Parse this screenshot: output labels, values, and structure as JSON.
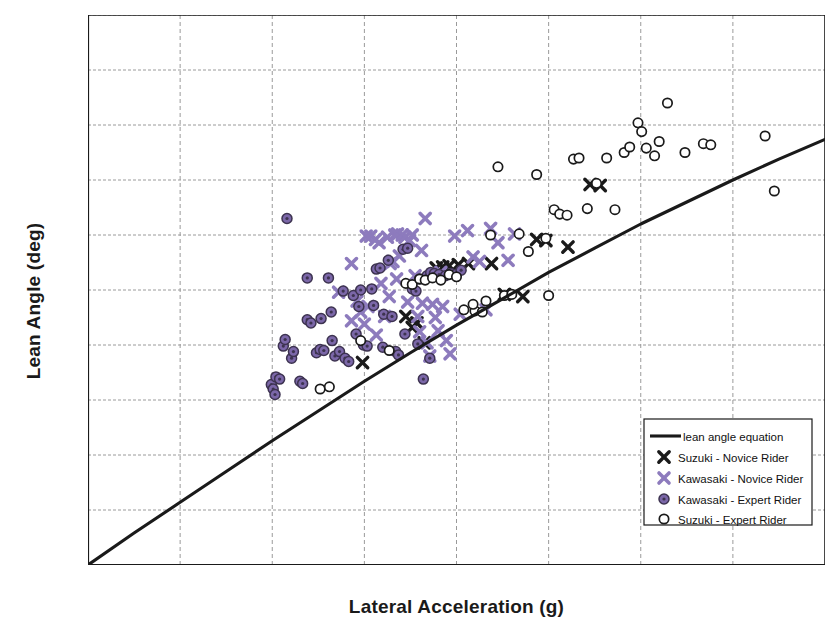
{
  "chart_data": {
    "type": "scatter",
    "title": "",
    "xlabel": "Lateral Acceleration (g)",
    "ylabel": "Lean Angle (deg)",
    "xlim": [
      0.0,
      0.8
    ],
    "ylim": [
      0,
      50
    ],
    "xticks": [
      "0.0",
      "0.1",
      "0.2",
      "0.3",
      "0.4",
      "0.5",
      "0.6",
      "0.7",
      "0.8"
    ],
    "xtick_values": [
      0.0,
      0.1,
      0.2,
      0.3,
      0.4,
      0.5,
      0.6,
      0.7,
      0.8
    ],
    "yticks": [
      "0",
      "5",
      "10",
      "15",
      "20",
      "25",
      "30",
      "35",
      "40",
      "45",
      "50"
    ],
    "ytick_values": [
      0,
      5,
      10,
      15,
      20,
      25,
      30,
      35,
      40,
      45,
      50
    ],
    "grid": true,
    "grid_style": "dashed",
    "legend_position": "lower-right",
    "colors": {
      "suzuki_novice": "#1a1a1a",
      "kawasaki_novice": "#8d7bbd",
      "kawasaki_expert": "#7b67a8",
      "kawasaki_expert_edge": "#3d3350",
      "suzuki_expert": "#ffffff",
      "suzuki_expert_edge": "#1a1a1a",
      "curve": "#1a1a1a",
      "grid": "#9a9a9a",
      "axis": "#1a1a1a"
    },
    "legend": [
      {
        "label": "lean angle equation",
        "marker": "line"
      },
      {
        "label": "Suzuki - Novice Rider",
        "marker": "cross-black"
      },
      {
        "label": "Kawasaki - Novice Rider",
        "marker": "cross-purple"
      },
      {
        "label": "Kawasaki - Expert Rider",
        "marker": "circle-purple-filled"
      },
      {
        "label": "Suzuki - Expert Rider",
        "marker": "circle-open"
      }
    ],
    "curve": {
      "name": "lean angle equation",
      "equation": "lean angle = atan(lateral acceleration)",
      "points": [
        [
          0.0,
          0.0
        ],
        [
          0.05,
          2.9
        ],
        [
          0.1,
          5.7
        ],
        [
          0.15,
          8.5
        ],
        [
          0.2,
          11.3
        ],
        [
          0.25,
          14.0
        ],
        [
          0.3,
          16.7
        ],
        [
          0.35,
          19.3
        ],
        [
          0.4,
          21.8
        ],
        [
          0.45,
          24.2
        ],
        [
          0.5,
          26.6
        ],
        [
          0.55,
          28.8
        ],
        [
          0.6,
          31.0
        ],
        [
          0.65,
          33.0
        ],
        [
          0.7,
          35.0
        ],
        [
          0.75,
          36.9
        ],
        [
          0.8,
          38.7
        ]
      ]
    },
    "series": [
      {
        "name": "Suzuki - Novice Rider",
        "marker": "cross-black",
        "points": [
          [
            0.298,
            18.4
          ],
          [
            0.352,
            21.6
          ],
          [
            0.357,
            22.0
          ],
          [
            0.378,
            27.0
          ],
          [
            0.385,
            27.1
          ],
          [
            0.392,
            27.2
          ],
          [
            0.402,
            27.3
          ],
          [
            0.413,
            27.4
          ],
          [
            0.438,
            27.4
          ],
          [
            0.452,
            24.6
          ],
          [
            0.472,
            24.4
          ],
          [
            0.487,
            29.6
          ],
          [
            0.497,
            29.5
          ],
          [
            0.521,
            28.9
          ],
          [
            0.545,
            34.6
          ],
          [
            0.556,
            34.5
          ],
          [
            0.345,
            22.6
          ],
          [
            0.365,
            20.2
          ]
        ]
      },
      {
        "name": "Kawasaki - Novice Rider",
        "marker": "cross-purple",
        "points": [
          [
            0.272,
            24.8
          ],
          [
            0.286,
            22.2
          ],
          [
            0.292,
            24.0
          ],
          [
            0.296,
            23.0
          ],
          [
            0.302,
            29.9
          ],
          [
            0.307,
            29.9
          ],
          [
            0.312,
            29.6
          ],
          [
            0.316,
            29.3
          ],
          [
            0.318,
            25.6
          ],
          [
            0.322,
            22.6
          ],
          [
            0.325,
            29.8
          ],
          [
            0.328,
            27.4
          ],
          [
            0.331,
            27.6
          ],
          [
            0.333,
            30.0
          ],
          [
            0.336,
            30.1
          ],
          [
            0.338,
            28.1
          ],
          [
            0.341,
            30.0
          ],
          [
            0.344,
            29.8
          ],
          [
            0.347,
            23.9
          ],
          [
            0.349,
            29.5
          ],
          [
            0.352,
            30.0
          ],
          [
            0.355,
            26.3
          ],
          [
            0.358,
            22.6
          ],
          [
            0.36,
            21.2
          ],
          [
            0.363,
            23.8
          ],
          [
            0.366,
            31.5
          ],
          [
            0.368,
            20.2
          ],
          [
            0.371,
            19.0
          ],
          [
            0.374,
            23.7
          ],
          [
            0.377,
            22.5
          ],
          [
            0.38,
            21.3
          ],
          [
            0.385,
            23.5
          ],
          [
            0.389,
            20.4
          ],
          [
            0.393,
            19.2
          ],
          [
            0.398,
            29.9
          ],
          [
            0.404,
            22.8
          ],
          [
            0.412,
            30.4
          ],
          [
            0.418,
            28.0
          ],
          [
            0.425,
            27.6
          ],
          [
            0.432,
            23.2
          ],
          [
            0.437,
            30.6
          ],
          [
            0.445,
            29.3
          ],
          [
            0.286,
            27.4
          ],
          [
            0.304,
            23.5
          ],
          [
            0.313,
            20.9
          ],
          [
            0.335,
            26.0
          ],
          [
            0.362,
            28.6
          ],
          [
            0.383,
            26.6
          ],
          [
            0.3,
            21.9
          ],
          [
            0.327,
            24.4
          ],
          [
            0.456,
            27.7
          ],
          [
            0.463,
            30.1
          ]
        ]
      },
      {
        "name": "Kawasaki - Expert Rider",
        "marker": "circle-purple-filled",
        "points": [
          [
            0.199,
            16.4
          ],
          [
            0.201,
            16.0
          ],
          [
            0.203,
            15.5
          ],
          [
            0.204,
            17.1
          ],
          [
            0.208,
            16.9
          ],
          [
            0.212,
            19.9
          ],
          [
            0.214,
            20.5
          ],
          [
            0.216,
            31.5
          ],
          [
            0.221,
            18.8
          ],
          [
            0.223,
            19.4
          ],
          [
            0.23,
            16.7
          ],
          [
            0.233,
            16.5
          ],
          [
            0.238,
            22.3
          ],
          [
            0.242,
            22.0
          ],
          [
            0.248,
            19.3
          ],
          [
            0.252,
            19.6
          ],
          [
            0.256,
            19.5
          ],
          [
            0.261,
            26.1
          ],
          [
            0.264,
            23.0
          ],
          [
            0.268,
            19.0
          ],
          [
            0.273,
            19.4
          ],
          [
            0.279,
            18.8
          ],
          [
            0.283,
            18.5
          ],
          [
            0.288,
            24.5
          ],
          [
            0.291,
            21.0
          ],
          [
            0.294,
            23.5
          ],
          [
            0.299,
            20.0
          ],
          [
            0.303,
            19.9
          ],
          [
            0.308,
            25.1
          ],
          [
            0.313,
            26.9
          ],
          [
            0.317,
            27.0
          ],
          [
            0.321,
            22.8
          ],
          [
            0.326,
            27.7
          ],
          [
            0.33,
            22.6
          ],
          [
            0.334,
            19.4
          ],
          [
            0.337,
            19.1
          ],
          [
            0.342,
            28.7
          ],
          [
            0.347,
            28.8
          ],
          [
            0.352,
            25.1
          ],
          [
            0.356,
            24.9
          ],
          [
            0.36,
            26.0
          ],
          [
            0.364,
            16.9
          ],
          [
            0.368,
            26.3
          ],
          [
            0.372,
            26.6
          ],
          [
            0.376,
            26.5
          ],
          [
            0.381,
            26.4
          ],
          [
            0.388,
            26.3
          ],
          [
            0.394,
            26.5
          ],
          [
            0.399,
            26.4
          ],
          [
            0.405,
            26.8
          ],
          [
            0.238,
            26.1
          ],
          [
            0.253,
            22.4
          ],
          [
            0.265,
            20.4
          ],
          [
            0.277,
            24.9
          ],
          [
            0.296,
            25.0
          ],
          [
            0.31,
            23.6
          ],
          [
            0.32,
            19.8
          ],
          [
            0.344,
            21.0
          ],
          [
            0.358,
            20.1
          ],
          [
            0.371,
            18.8
          ]
        ]
      },
      {
        "name": "Suzuki - Expert Rider",
        "marker": "circle-open",
        "points": [
          [
            0.252,
            16.0
          ],
          [
            0.262,
            16.2
          ],
          [
            0.296,
            20.4
          ],
          [
            0.327,
            19.5
          ],
          [
            0.345,
            25.6
          ],
          [
            0.352,
            25.5
          ],
          [
            0.36,
            26.0
          ],
          [
            0.366,
            25.9
          ],
          [
            0.374,
            26.1
          ],
          [
            0.383,
            25.9
          ],
          [
            0.392,
            26.4
          ],
          [
            0.4,
            26.2
          ],
          [
            0.408,
            23.2
          ],
          [
            0.42,
            23.1
          ],
          [
            0.428,
            23.0
          ],
          [
            0.432,
            24.0
          ],
          [
            0.445,
            36.2
          ],
          [
            0.452,
            24.5
          ],
          [
            0.46,
            24.6
          ],
          [
            0.468,
            30.1
          ],
          [
            0.478,
            28.5
          ],
          [
            0.487,
            35.5
          ],
          [
            0.497,
            29.7
          ],
          [
            0.506,
            32.3
          ],
          [
            0.512,
            31.9
          ],
          [
            0.52,
            31.8
          ],
          [
            0.527,
            36.9
          ],
          [
            0.533,
            37.0
          ],
          [
            0.542,
            32.4
          ],
          [
            0.552,
            34.7
          ],
          [
            0.563,
            37.0
          ],
          [
            0.572,
            32.3
          ],
          [
            0.582,
            37.5
          ],
          [
            0.588,
            38.0
          ],
          [
            0.597,
            40.2
          ],
          [
            0.601,
            39.4
          ],
          [
            0.606,
            37.9
          ],
          [
            0.615,
            37.2
          ],
          [
            0.62,
            38.5
          ],
          [
            0.629,
            42.0
          ],
          [
            0.648,
            37.5
          ],
          [
            0.668,
            38.3
          ],
          [
            0.676,
            38.2
          ],
          [
            0.735,
            39.0
          ],
          [
            0.745,
            34.0
          ],
          [
            0.437,
            30.0
          ],
          [
            0.418,
            23.7
          ],
          [
            0.5,
            24.5
          ]
        ]
      }
    ]
  }
}
